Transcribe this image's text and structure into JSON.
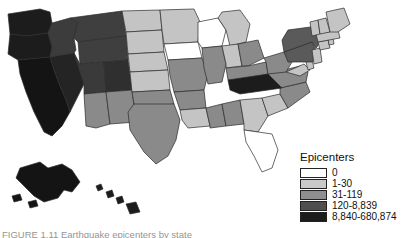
{
  "figure": {
    "background_color": "#ffffff",
    "caption_partial": "FIGURE  1.11   Earthquake epicenters by state"
  },
  "legend": {
    "title": "Epicenters",
    "entries": [
      {
        "label": "0",
        "color": "#ffffff"
      },
      {
        "label": "1-30",
        "color": "#c9c9c9"
      },
      {
        "label": "31-119",
        "color": "#8f8f8f"
      },
      {
        "label": "120-8,839",
        "color": "#4f4f4f"
      },
      {
        "label": "8,840-680,874",
        "color": "#1c1c1c"
      }
    ]
  },
  "chart_data": {
    "type": "map",
    "title": "Epicenters",
    "legend_position": "bottom-right",
    "scale_type": "categorical-choropleth",
    "categories": [
      "0",
      "1-30",
      "31-119",
      "120-8,839",
      "8,840-680,874"
    ],
    "category_colors": [
      "#ffffff",
      "#c9c9c9",
      "#8f8f8f",
      "#4f4f4f",
      "#1c1c1c"
    ],
    "regions": [
      {
        "state": "WA",
        "category": "8,840-680,874",
        "color": "#1c1c1c"
      },
      {
        "state": "OR",
        "category": "8,840-680,874",
        "color": "#1c1c1c"
      },
      {
        "state": "CA",
        "category": "8,840-680,874",
        "color": "#141414"
      },
      {
        "state": "ID",
        "category": "120-8,839",
        "color": "#3c3c3c"
      },
      {
        "state": "NV",
        "category": "8,840-680,874",
        "color": "#242424"
      },
      {
        "state": "MT",
        "category": "120-8,839",
        "color": "#3f3f3f"
      },
      {
        "state": "WY",
        "category": "120-8,839",
        "color": "#3f3f3f"
      },
      {
        "state": "UT",
        "category": "120-8,839",
        "color": "#3a3a3a"
      },
      {
        "state": "AZ",
        "category": "31-119",
        "color": "#8a8a8a"
      },
      {
        "state": "CO",
        "category": "120-8,839",
        "color": "#2f2f2f"
      },
      {
        "state": "NM",
        "category": "31-119",
        "color": "#8a8a8a"
      },
      {
        "state": "ND",
        "category": "1-30",
        "color": "#c4c4c4"
      },
      {
        "state": "SD",
        "category": "1-30",
        "color": "#c4c4c4"
      },
      {
        "state": "NE",
        "category": "1-30",
        "color": "#c4c4c4"
      },
      {
        "state": "KS",
        "category": "1-30",
        "color": "#c4c4c4"
      },
      {
        "state": "OK",
        "category": "31-119",
        "color": "#8a8a8a"
      },
      {
        "state": "TX",
        "category": "31-119",
        "color": "#8a8a8a"
      },
      {
        "state": "MN",
        "category": "1-30",
        "color": "#c4c4c4"
      },
      {
        "state": "IA",
        "category": "0",
        "color": "#ffffff"
      },
      {
        "state": "MO",
        "category": "31-119",
        "color": "#8a8a8a"
      },
      {
        "state": "AR",
        "category": "31-119",
        "color": "#8a8a8a"
      },
      {
        "state": "LA",
        "category": "1-30",
        "color": "#c4c4c4"
      },
      {
        "state": "WI",
        "category": "0",
        "color": "#ffffff"
      },
      {
        "state": "IL",
        "category": "31-119",
        "color": "#8a8a8a"
      },
      {
        "state": "MI",
        "category": "1-30",
        "color": "#c4c4c4"
      },
      {
        "state": "IN",
        "category": "1-30",
        "color": "#c4c4c4"
      },
      {
        "state": "OH",
        "category": "31-119",
        "color": "#8a8a8a"
      },
      {
        "state": "KY",
        "category": "31-119",
        "color": "#8a8a8a"
      },
      {
        "state": "TN",
        "category": "8,840-680,874",
        "color": "#1c1c1c"
      },
      {
        "state": "MS",
        "category": "31-119",
        "color": "#8a8a8a"
      },
      {
        "state": "AL",
        "category": "31-119",
        "color": "#8a8a8a"
      },
      {
        "state": "GA",
        "category": "1-30",
        "color": "#c4c4c4"
      },
      {
        "state": "FL",
        "category": "0",
        "color": "#ffffff"
      },
      {
        "state": "SC",
        "category": "1-30",
        "color": "#c4c4c4"
      },
      {
        "state": "NC",
        "category": "31-119",
        "color": "#8a8a8a"
      },
      {
        "state": "VA",
        "category": "31-119",
        "color": "#8a8a8a"
      },
      {
        "state": "WV",
        "category": "31-119",
        "color": "#8a8a8a"
      },
      {
        "state": "MD",
        "category": "1-30",
        "color": "#c4c4c4"
      },
      {
        "state": "DE",
        "category": "1-30",
        "color": "#c4c4c4"
      },
      {
        "state": "PA",
        "category": "120-8,839",
        "color": "#5a5a5a"
      },
      {
        "state": "NJ",
        "category": "1-30",
        "color": "#c4c4c4"
      },
      {
        "state": "NY",
        "category": "120-8,839",
        "color": "#5a5a5a"
      },
      {
        "state": "CT",
        "category": "1-30",
        "color": "#c4c4c4"
      },
      {
        "state": "RI",
        "category": "1-30",
        "color": "#c4c4c4"
      },
      {
        "state": "MA",
        "category": "1-30",
        "color": "#c4c4c4"
      },
      {
        "state": "VT",
        "category": "1-30",
        "color": "#c4c4c4"
      },
      {
        "state": "NH",
        "category": "1-30",
        "color": "#c4c4c4"
      },
      {
        "state": "ME",
        "category": "1-30",
        "color": "#c4c4c4"
      },
      {
        "state": "AK",
        "category": "8,840-680,874",
        "color": "#141414"
      },
      {
        "state": "HI",
        "category": "8,840-680,874",
        "color": "#1c1c1c"
      }
    ]
  }
}
